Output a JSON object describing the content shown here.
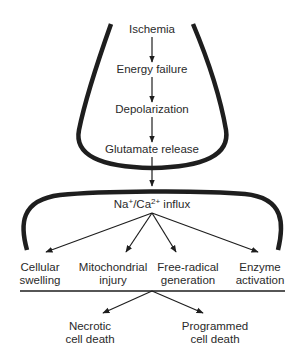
{
  "diagram": {
    "funnel": {
      "steps": [
        {
          "id": "ischemia",
          "label": "Ischemia"
        },
        {
          "id": "energy-failure",
          "label": "Energy failure"
        },
        {
          "id": "depolarization",
          "label": "Depolarization"
        },
        {
          "id": "glutamate-release",
          "label": "Glutamate release"
        }
      ]
    },
    "influx": {
      "na": "Na",
      "na_sup": "+",
      "sep": "/Ca",
      "ca_sup": "2+",
      "rest": " influx"
    },
    "effects": [
      {
        "id": "cellular-swelling",
        "line1": "Cellular",
        "line2": "swelling"
      },
      {
        "id": "mitochondrial-injury",
        "line1": "Mitochondrial",
        "line2": "injury"
      },
      {
        "id": "free-radical-generation",
        "line1": "Free-radical",
        "line2": "generation"
      },
      {
        "id": "enzyme-activation",
        "line1": "Enzyme",
        "line2": "activation"
      }
    ],
    "outcomes": [
      {
        "id": "necrotic-cell-death",
        "line1": "Necrotic",
        "line2": "cell death"
      },
      {
        "id": "programmed-cell-death",
        "line1": "Programmed",
        "line2": "cell death"
      }
    ],
    "colors": {
      "stroke": "#1e1e1e",
      "text": "#2a2a2a",
      "background": "#ffffff"
    }
  }
}
